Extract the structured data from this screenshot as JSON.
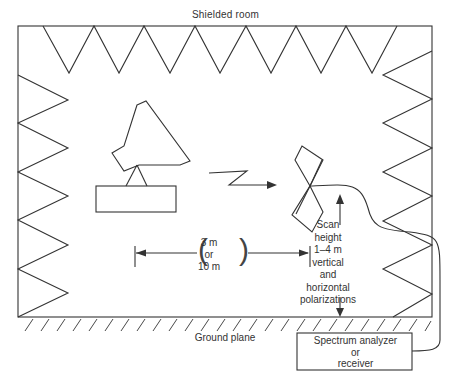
{
  "diagram": {
    "title": "Shielded room",
    "ground_label": "Ground plane",
    "distance": {
      "line1": "3 m",
      "line2": "or",
      "line3": "10 m"
    },
    "scan": {
      "line1": "Scan",
      "line2": "height",
      "line3": "1–4 m",
      "line4": "vertical",
      "line5": "and",
      "line6": "horizontal",
      "line7": "polarizations"
    },
    "analyzer": {
      "line1": "Spectrum analyzer",
      "line2": "or",
      "line3": "receiver"
    },
    "elements": {
      "transmit_antenna": "horn-antenna-on-pedestal",
      "signal_symbol": "lightning-arrow",
      "receive_antenna": "biconical-antenna",
      "absorbers": "pyramidal-absorber-zigzag",
      "cable": "coaxial-cable-to-analyzer"
    },
    "colors": {
      "line": "#333333",
      "background": "#ffffff"
    }
  }
}
